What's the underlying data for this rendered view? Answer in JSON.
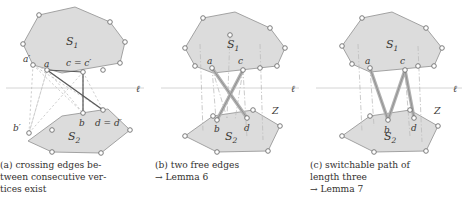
{
  "figure": {
    "background": "#ffffff",
    "polygon_fill": "#dcdcdc",
    "polygon_stroke": "#8f8f8f",
    "vertex_fill": "#ffffff",
    "vertex_stroke": "#6e6e6e",
    "solid_edge_color": "#4a4a4a",
    "dashed_edge_color": "#b5b5b5",
    "thick_edge_color": "#b0b0b0",
    "line_l_color": "#c8c8c8",
    "label_color": "#3a3835"
  },
  "panels": [
    {
      "id": "panel-a",
      "upper_region_label": "S_1",
      "lower_region_label": "S_2",
      "line_label": "l",
      "z_label": "",
      "vertex_labels": [
        {
          "name": "a-prime",
          "text": "a′"
        },
        {
          "name": "a",
          "text": "a"
        },
        {
          "name": "c-equals-c-prime",
          "text": "c = c′"
        },
        {
          "name": "b",
          "text": "b"
        },
        {
          "name": "d-equals-d-prime",
          "text": "d = d′"
        },
        {
          "name": "b-prime",
          "text": "b′"
        }
      ],
      "caption_lines": [
        "(a)  crossing  edges  be-",
        "tween   consecutive   ver-",
        "tices exist"
      ],
      "caption_ref": ""
    },
    {
      "id": "panel-b",
      "upper_region_label": "S_1",
      "lower_region_label": "S_2",
      "line_label": "l",
      "z_label": "Z",
      "vertex_labels": [
        {
          "name": "a",
          "text": "a"
        },
        {
          "name": "c",
          "text": "c"
        },
        {
          "name": "b",
          "text": "b"
        },
        {
          "name": "d",
          "text": "d"
        }
      ],
      "caption_lines": [
        "(b) two free edges"
      ],
      "caption_ref": "→ Lemma 6"
    },
    {
      "id": "panel-c",
      "upper_region_label": "S_1",
      "lower_region_label": "S_2",
      "line_label": "l",
      "z_label": "Z",
      "vertex_labels": [
        {
          "name": "a",
          "text": "a"
        },
        {
          "name": "c",
          "text": "c"
        },
        {
          "name": "b",
          "text": "b"
        },
        {
          "name": "d",
          "text": "d"
        }
      ],
      "caption_lines": [
        "(c)  switchable  path  of",
        "length three"
      ],
      "caption_ref": "→ Lemma 7"
    }
  ],
  "symbols": {
    "S1_base": "S",
    "S1_sub": "1",
    "S2_base": "S",
    "S2_sub": "2",
    "ell": "ℓ",
    "Z": "Z"
  }
}
